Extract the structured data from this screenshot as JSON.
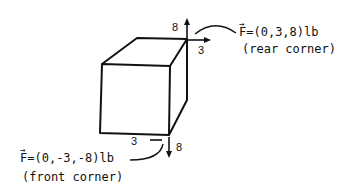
{
  "diagram": {
    "rear_force": {
      "vector_label": "F",
      "equation": "=(0,3,8)lb",
      "corner": "(rear corner)",
      "up_component": "8",
      "side_component": "3"
    },
    "front_force": {
      "vector_label": "F",
      "equation": "=(0,-3,-8)lb",
      "corner": "(front corner)",
      "down_component": "8",
      "side_component": "3"
    }
  }
}
